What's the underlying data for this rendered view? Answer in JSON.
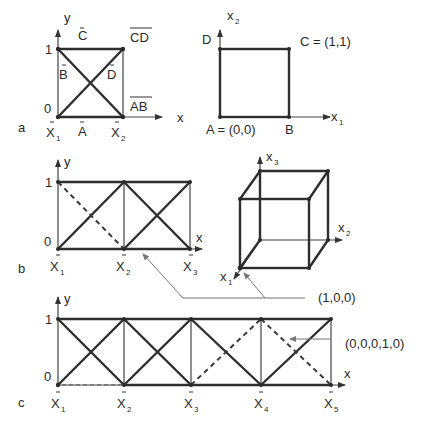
{
  "panels": {
    "a": {
      "tag": "a",
      "axis_y": "y",
      "axis_x": "x",
      "tick_1": "1",
      "tick_0": "0",
      "coord_1": "X",
      "coord_1_sub": "1",
      "coord_2": "X",
      "coord_2_sub": "2",
      "edge_top": "C",
      "edge_left": "B",
      "edge_bottom": "A",
      "edge_diag": "D",
      "corner_top_right": "CD",
      "corner_bottom_right": "AB",
      "square": {
        "axis_x": "x",
        "axis_x_sub": "1",
        "axis_y": "x",
        "axis_y_sub": "2",
        "vertex_a": "A = (0,0)",
        "vertex_b": "B",
        "vertex_c": "C = (1,1)",
        "vertex_d": "D"
      }
    },
    "b": {
      "tag": "b",
      "axis_y": "y",
      "axis_x": "x",
      "tick_1": "1",
      "tick_0": "0",
      "coords": [
        {
          "label": "X",
          "sub": "1"
        },
        {
          "label": "X",
          "sub": "2"
        },
        {
          "label": "X",
          "sub": "3"
        }
      ],
      "cube": {
        "axis_1": "x",
        "axis_1_sub": "1",
        "axis_2": "x",
        "axis_2_sub": "2",
        "axis_3": "x",
        "axis_3_sub": "3"
      },
      "callout": "(1,0,0)"
    },
    "c": {
      "tag": "c",
      "axis_y": "y",
      "axis_x": "x",
      "tick_1": "1",
      "tick_0": "0",
      "coords": [
        {
          "label": "X",
          "sub": "1"
        },
        {
          "label": "X",
          "sub": "2"
        },
        {
          "label": "X",
          "sub": "3"
        },
        {
          "label": "X",
          "sub": "4"
        },
        {
          "label": "X",
          "sub": "5"
        }
      ],
      "callout": "(0,0,0,1,0)"
    }
  }
}
